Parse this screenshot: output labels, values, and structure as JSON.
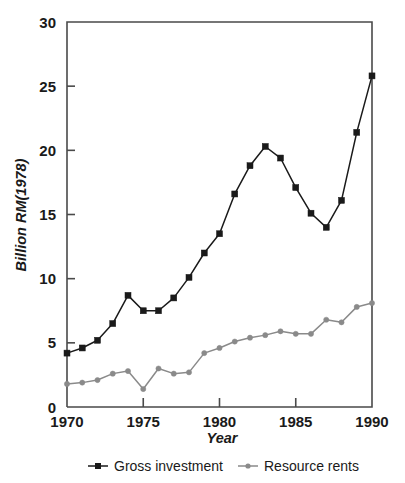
{
  "chart_data": {
    "type": "line",
    "title": "",
    "xlabel": "Year",
    "ylabel": "Billion RM(1978)",
    "xlim": [
      1970,
      1990
    ],
    "ylim": [
      0,
      30
    ],
    "xticks": [
      1970,
      1975,
      1980,
      1985,
      1990
    ],
    "yticks": [
      0,
      5,
      10,
      15,
      20,
      25,
      30
    ],
    "xtick_labels": [
      "1970",
      "1975",
      "1980",
      "1985",
      "1990"
    ],
    "ytick_labels": [
      "0",
      "5",
      "10",
      "15",
      "20",
      "25",
      "30"
    ],
    "grid": false,
    "legend_position": "below",
    "x": [
      1970,
      1971,
      1972,
      1973,
      1974,
      1975,
      1976,
      1977,
      1978,
      1979,
      1980,
      1981,
      1982,
      1983,
      1984,
      1985,
      1986,
      1987,
      1988,
      1989,
      1990
    ],
    "series": [
      {
        "name": "Gross investment",
        "color": "#1a1a1a",
        "marker": "square",
        "values": [
          4.2,
          4.6,
          5.2,
          6.5,
          8.7,
          7.5,
          7.5,
          8.5,
          10.1,
          12.0,
          13.5,
          16.6,
          18.8,
          20.3,
          19.4,
          17.1,
          15.1,
          14.0,
          16.1,
          21.4,
          25.8
        ]
      },
      {
        "name": "Resource rents",
        "color": "#8a8a8a",
        "marker": "circle",
        "values": [
          1.8,
          1.9,
          2.1,
          2.6,
          2.8,
          1.4,
          3.0,
          2.6,
          2.7,
          4.2,
          4.6,
          5.1,
          5.4,
          5.6,
          5.9,
          5.7,
          5.7,
          6.8,
          6.6,
          7.8,
          8.1
        ]
      }
    ]
  },
  "legend": {
    "items": [
      {
        "label": "Gross investment",
        "color": "#1a1a1a",
        "marker": "square"
      },
      {
        "label": "Resource rents",
        "color": "#8a8a8a",
        "marker": "circle"
      }
    ]
  }
}
